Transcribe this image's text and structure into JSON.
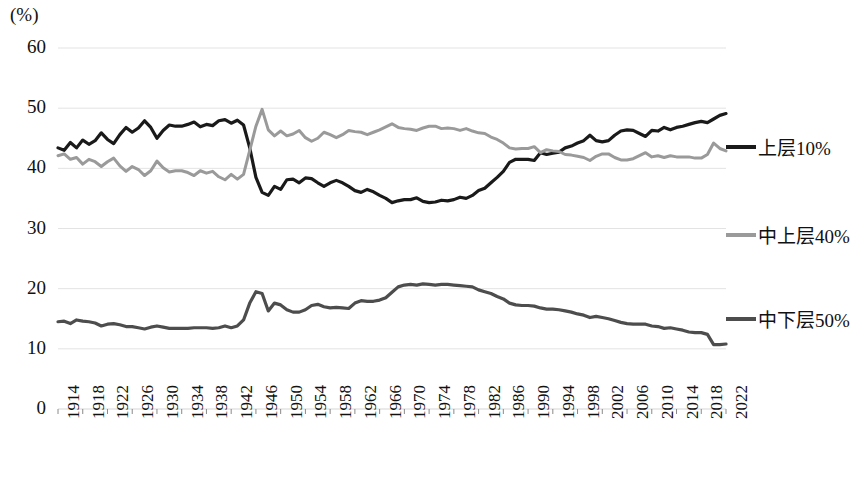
{
  "chart_data": {
    "type": "line",
    "title": "",
    "unit_label": "(%)",
    "xlabel": "",
    "ylabel": "",
    "ylim": [
      0,
      60
    ],
    "yticks": [
      0,
      10,
      20,
      30,
      40,
      50,
      60
    ],
    "xlim": [
      1914,
      2022
    ],
    "xticks": [
      1914,
      1918,
      1922,
      1926,
      1930,
      1934,
      1938,
      1942,
      1946,
      1950,
      1954,
      1958,
      1962,
      1966,
      1970,
      1974,
      1978,
      1982,
      1986,
      1990,
      1994,
      1998,
      2002,
      2006,
      2010,
      2014,
      2018,
      2022
    ],
    "grid": true,
    "legend_position": "right",
    "colors": {
      "top10": "#1a1a1a",
      "upper40": "#9a9a9a",
      "lower50": "#4d4d4d"
    },
    "x": [
      1914,
      1915,
      1916,
      1917,
      1918,
      1919,
      1920,
      1921,
      1922,
      1923,
      1924,
      1925,
      1926,
      1927,
      1928,
      1929,
      1930,
      1931,
      1932,
      1933,
      1934,
      1935,
      1936,
      1937,
      1938,
      1939,
      1940,
      1941,
      1942,
      1943,
      1944,
      1945,
      1946,
      1947,
      1948,
      1949,
      1950,
      1951,
      1952,
      1953,
      1954,
      1955,
      1956,
      1957,
      1958,
      1959,
      1960,
      1961,
      1962,
      1963,
      1964,
      1965,
      1966,
      1967,
      1968,
      1969,
      1970,
      1971,
      1972,
      1973,
      1974,
      1975,
      1976,
      1977,
      1978,
      1979,
      1980,
      1981,
      1982,
      1983,
      1984,
      1985,
      1986,
      1987,
      1988,
      1989,
      1990,
      1991,
      1992,
      1993,
      1994,
      1995,
      1996,
      1997,
      1998,
      1999,
      2000,
      2001,
      2002,
      2003,
      2004,
      2005,
      2006,
      2007,
      2008,
      2009,
      2010,
      2011,
      2012,
      2013,
      2014,
      2015,
      2016,
      2017,
      2018,
      2019,
      2020,
      2021,
      2022
    ],
    "series": [
      {
        "name": "上层10%",
        "key": "top10",
        "color": "#1a1a1a",
        "values": [
          43.4,
          43.0,
          44.3,
          43.4,
          44.7,
          44.0,
          44.6,
          45.9,
          44.8,
          44.1,
          45.6,
          46.8,
          46.0,
          46.7,
          47.9,
          46.8,
          45.0,
          46.3,
          47.2,
          47.0,
          47.0,
          47.3,
          47.7,
          46.9,
          47.3,
          47.1,
          47.9,
          48.1,
          47.5,
          48.0,
          47.2,
          43.4,
          38.5,
          36.0,
          35.5,
          37.0,
          36.5,
          38.1,
          38.2,
          37.6,
          38.4,
          38.3,
          37.6,
          37.0,
          37.6,
          38.0,
          37.6,
          37.0,
          36.3,
          36.0,
          36.5,
          36.1,
          35.5,
          35.0,
          34.3,
          34.6,
          34.8,
          34.8,
          35.1,
          34.5,
          34.3,
          34.4,
          34.7,
          34.6,
          34.8,
          35.2,
          35.0,
          35.5,
          36.3,
          36.7,
          37.6,
          38.5,
          39.5,
          41.0,
          41.5,
          41.5,
          41.5,
          41.3,
          42.6,
          42.3,
          42.5,
          42.7,
          43.4,
          43.7,
          44.2,
          44.6,
          45.5,
          44.6,
          44.4,
          44.6,
          45.5,
          46.2,
          46.4,
          46.3,
          45.8,
          45.3,
          46.3,
          46.2,
          46.8,
          46.4,
          46.8,
          47.0,
          47.3,
          47.6,
          47.8,
          47.6,
          48.2,
          48.8,
          49.1
        ]
      },
      {
        "name": "中上层40%",
        "key": "upper40",
        "color": "#9a9a9a",
        "values": [
          42.1,
          42.4,
          41.5,
          41.8,
          40.7,
          41.5,
          41.1,
          40.3,
          41.1,
          41.7,
          40.4,
          39.5,
          40.3,
          39.8,
          38.8,
          39.6,
          41.2,
          40.1,
          39.4,
          39.6,
          39.6,
          39.3,
          38.8,
          39.6,
          39.2,
          39.5,
          38.6,
          38.1,
          39.0,
          38.2,
          39.0,
          43.0,
          47.0,
          49.8,
          46.4,
          45.4,
          46.2,
          45.4,
          45.7,
          46.3,
          45.1,
          44.5,
          45.0,
          46.0,
          45.6,
          45.1,
          45.6,
          46.3,
          46.1,
          46.0,
          45.6,
          46.0,
          46.4,
          46.9,
          47.4,
          46.8,
          46.6,
          46.5,
          46.3,
          46.7,
          47.0,
          47.0,
          46.6,
          46.7,
          46.6,
          46.3,
          46.6,
          46.2,
          45.9,
          45.8,
          45.2,
          44.8,
          44.2,
          43.4,
          43.2,
          43.3,
          43.3,
          43.6,
          42.6,
          43.1,
          42.9,
          42.8,
          42.3,
          42.2,
          42.0,
          41.8,
          41.3,
          42.0,
          42.4,
          42.4,
          41.8,
          41.4,
          41.4,
          41.6,
          42.1,
          42.6,
          41.9,
          42.1,
          41.8,
          42.1,
          41.9,
          41.9,
          41.9,
          41.7,
          41.7,
          42.3,
          44.2,
          43.3,
          42.9
        ]
      },
      {
        "name": "中下层50%",
        "key": "lower50",
        "color": "#4d4d4d",
        "values": [
          14.5,
          14.6,
          14.2,
          14.8,
          14.6,
          14.5,
          14.3,
          13.8,
          14.1,
          14.2,
          14.0,
          13.7,
          13.7,
          13.5,
          13.3,
          13.6,
          13.8,
          13.6,
          13.4,
          13.4,
          13.4,
          13.4,
          13.5,
          13.5,
          13.5,
          13.4,
          13.5,
          13.8,
          13.5,
          13.8,
          14.8,
          17.6,
          19.5,
          19.2,
          16.3,
          17.6,
          17.3,
          16.5,
          16.1,
          16.1,
          16.5,
          17.2,
          17.4,
          17.0,
          16.8,
          16.9,
          16.8,
          16.7,
          17.6,
          18.0,
          17.9,
          17.9,
          18.1,
          18.5,
          19.4,
          20.3,
          20.6,
          20.7,
          20.6,
          20.8,
          20.7,
          20.6,
          20.7,
          20.7,
          20.6,
          20.5,
          20.4,
          20.3,
          19.8,
          19.5,
          19.2,
          18.7,
          18.3,
          17.6,
          17.3,
          17.2,
          17.2,
          17.1,
          16.8,
          16.6,
          16.6,
          16.5,
          16.3,
          16.1,
          15.8,
          15.6,
          15.2,
          15.4,
          15.2,
          15.0,
          14.7,
          14.4,
          14.2,
          14.1,
          14.1,
          14.1,
          13.8,
          13.7,
          13.4,
          13.5,
          13.3,
          13.1,
          12.8,
          12.7,
          12.7,
          12.4,
          10.7,
          10.7,
          10.8
        ]
      }
    ]
  },
  "legend": [
    {
      "label": "上层10%",
      "color": "#1a1a1a"
    },
    {
      "label": "中上层40%",
      "color": "#9a9a9a"
    },
    {
      "label": "中下层50%",
      "color": "#4d4d4d"
    }
  ]
}
